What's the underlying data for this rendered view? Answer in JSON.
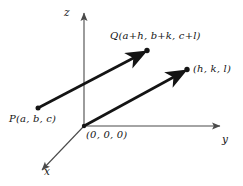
{
  "figure": {
    "background_color": "#ffffff",
    "stroke_color": "#141414",
    "axis_color": "#4a4a4a"
  },
  "axes": {
    "z": {
      "label": "z",
      "direction": "up",
      "origin": [
        84,
        126
      ],
      "tip": [
        84,
        11
      ]
    },
    "y": {
      "label": "y",
      "direction": "right",
      "origin": [
        84,
        126
      ],
      "tip": [
        222,
        126
      ]
    },
    "x": {
      "label": "x",
      "direction": "down-left",
      "origin": [
        84,
        126
      ],
      "tip": [
        40,
        172
      ]
    }
  },
  "points": [
    {
      "name": "origin",
      "label": "(0, 0, 0)",
      "coords": [
        84,
        126
      ]
    },
    {
      "name": "P",
      "label": "P(a, b, c)",
      "coords": [
        38,
        108
      ]
    },
    {
      "name": "Q",
      "label": "Q(a+h, b+k, c+l)",
      "coords": [
        147,
        51
      ]
    },
    {
      "name": "hkl",
      "label": "(h, k, l)",
      "coords": [
        187,
        70
      ]
    }
  ],
  "vectors": [
    {
      "name": "PQ",
      "from": "P",
      "to": "Q",
      "from_xy": [
        38,
        108
      ],
      "to_xy": [
        147,
        51
      ]
    },
    {
      "name": "OR",
      "from": "origin",
      "to": "hkl",
      "from_xy": [
        84,
        126
      ],
      "to_xy": [
        187,
        70
      ]
    }
  ]
}
